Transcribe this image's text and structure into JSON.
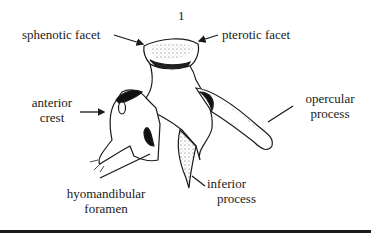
{
  "figure": {
    "number": "1",
    "labels": {
      "sphenotic_facet": "sphenotic facet",
      "pterotic_facet": "pterotic facet",
      "anterior_crest_line1": "anterior",
      "anterior_crest_line2": "crest",
      "opercular_process_line1": "opercular",
      "opercular_process_line2": "process",
      "hyomandibular_foramen_line1": "hyomandibular",
      "hyomandibular_foramen_line2": "foramen",
      "inferior_process_line1": "inferior",
      "inferior_process_line2": "process"
    }
  },
  "colors": {
    "ink": "#1a1a1a",
    "background": "#ffffff"
  }
}
